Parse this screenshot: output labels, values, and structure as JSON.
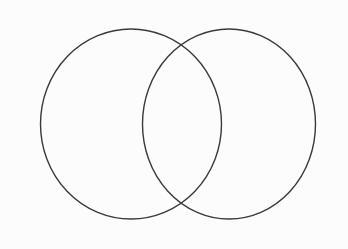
{
  "figure": {
    "name": "two-set-venn-diagram",
    "width": 348,
    "height": 249,
    "background_color": "#fcfcfc",
    "stroke_color": "#3a3a3c",
    "stroke_width": 1.4,
    "fill": "none"
  },
  "shapes": [
    {
      "name": "left-circle",
      "label": "",
      "cx": 131,
      "cy": 124,
      "rx": 90.5,
      "ry": 95,
      "stroke": "#3a3a3c",
      "fill": "none"
    },
    {
      "name": "right-circle",
      "label": "",
      "cx": 229,
      "cy": 124,
      "rx": 86.5,
      "ry": 95,
      "stroke": "#3a3a3c",
      "fill": "none"
    }
  ],
  "regions": [
    {
      "name": "left-only-region",
      "label": ""
    },
    {
      "name": "intersection-region",
      "label": ""
    },
    {
      "name": "right-only-region",
      "label": ""
    }
  ],
  "intersection_points": [
    {
      "name": "upper-intersection",
      "x": 174,
      "y": 38
    },
    {
      "name": "lower-intersection",
      "x": 177,
      "y": 209
    }
  ]
}
